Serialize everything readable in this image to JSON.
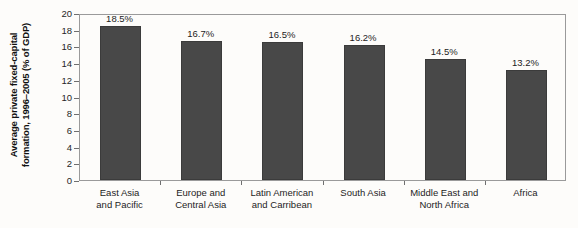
{
  "chart_data": {
    "type": "bar",
    "title": "",
    "xlabel": "",
    "ylabel": "Average private fixed-capital formation, 1996–2005 (% of GDP)",
    "ylabel_lines": [
      "Average private fixed-capital",
      "formation, 1996–2005 (% of GDP)"
    ],
    "categories": [
      "East Asia and Pacific",
      "Europe and Central Asia",
      "Latin American and Carribean",
      "South Asia",
      "Middle East and North Africa",
      "Africa"
    ],
    "category_label_lines": [
      [
        "East Asia",
        "and Pacific"
      ],
      [
        "Europe and",
        "Central Asia"
      ],
      [
        "Latin American",
        "and Carribean"
      ],
      [
        "South Asia"
      ],
      [
        "Middle East and",
        "North Africa"
      ],
      [
        "Africa"
      ]
    ],
    "values": [
      18.5,
      16.7,
      16.5,
      16.2,
      14.5,
      13.2
    ],
    "data_labels": [
      "18.5%",
      "16.7%",
      "16.5%",
      "16.2%",
      "14.5%",
      "13.2%"
    ],
    "ylim": [
      0,
      20
    ],
    "ytick_values": [
      20,
      18,
      16,
      14,
      12,
      10,
      8,
      6,
      4,
      2,
      0
    ],
    "ytick_labels": [
      "20",
      "18",
      "16",
      "14",
      "12",
      "10",
      "8",
      "6",
      "4",
      "2",
      "0"
    ],
    "grid": false,
    "legend": null,
    "bar_color": "#484848",
    "frame_color": "#9a9a9a",
    "background_color": "#fdfcfa"
  }
}
